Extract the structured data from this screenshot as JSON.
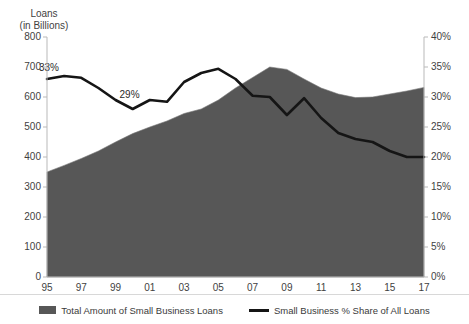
{
  "axes": {
    "y_left_title_line1": "Loans",
    "y_left_title_line2": "(in Billions)",
    "y_left_ticks": [
      "800",
      "700",
      "600",
      "500",
      "400",
      "300",
      "200",
      "100",
      "0"
    ],
    "y_right_ticks": [
      "40%",
      "35%",
      "30%",
      "25%",
      "20%",
      "15%",
      "10%",
      "5%",
      "0%"
    ],
    "x_ticks": [
      "95",
      "97",
      "99",
      "01",
      "03",
      "05",
      "07",
      "09",
      "11",
      "13",
      "15",
      "17"
    ]
  },
  "legend": {
    "items": [
      {
        "label": "Total Amount of Small Business Loans",
        "marker": "area-swatch",
        "color": "#575757"
      },
      {
        "label": "Small Business % Share of All Loans",
        "marker": "line-swatch",
        "color": "#151515"
      }
    ]
  },
  "annotations": [
    {
      "text": "33%",
      "x_year": 1995,
      "value_pct": 33,
      "tone": "dark"
    },
    {
      "text": "29%",
      "x_year": 1999,
      "value_pct": 29,
      "tone": "dark"
    },
    {
      "text": "30%",
      "x_year": 2008,
      "value_pct": 30,
      "tone": "light"
    },
    {
      "text": "27%",
      "x_year": 2009,
      "value_pct": 27,
      "tone": "light"
    },
    {
      "text": "20%",
      "x_year": 2016,
      "value_pct": 20,
      "tone": "light"
    }
  ],
  "chart_data": {
    "type": "area",
    "title": "",
    "subtitle": "",
    "xlabel": "",
    "ylabel": "Loans (in Billions)",
    "y2label": "",
    "xlim": [
      1995,
      2017
    ],
    "ylim": [
      0,
      800
    ],
    "y2lim": [
      0,
      40
    ],
    "grid": false,
    "legend_position": "bottom-center",
    "x": [
      1995,
      1996,
      1997,
      1998,
      1999,
      2000,
      2001,
      2002,
      2003,
      2004,
      2005,
      2006,
      2007,
      2008,
      2009,
      2010,
      2011,
      2012,
      2013,
      2014,
      2015,
      2016,
      2017
    ],
    "x_tick_labels": [
      "95",
      "97",
      "99",
      "01",
      "03",
      "05",
      "07",
      "09",
      "11",
      "13",
      "15",
      "17"
    ],
    "series": [
      {
        "name": "Total Amount of Small Business Loans",
        "type": "area",
        "axis": "left",
        "unit": "billions USD",
        "color": "#575757",
        "values": [
          350,
          372,
          395,
          420,
          450,
          478,
          500,
          520,
          545,
          560,
          590,
          630,
          665,
          700,
          692,
          660,
          630,
          610,
          598,
          600,
          610,
          620,
          632
        ]
      },
      {
        "name": "Small Business % Share of All Loans",
        "type": "line",
        "axis": "right",
        "unit": "percent",
        "color": "#151515",
        "values": [
          33,
          33.5,
          33.2,
          31.5,
          29.5,
          28.0,
          29.5,
          29.2,
          32.5,
          34.0,
          34.7,
          33.0,
          30.2,
          30.0,
          27.0,
          29.8,
          26.5,
          24.0,
          23.0,
          22.5,
          21.0,
          20.0,
          20.0
        ]
      }
    ]
  }
}
